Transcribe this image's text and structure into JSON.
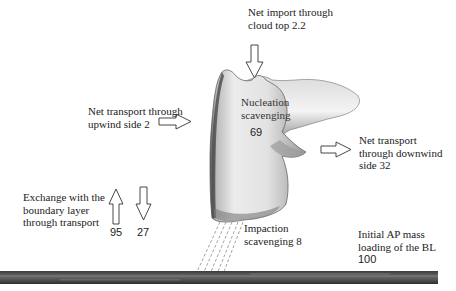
{
  "diagram": {
    "type": "aerosol-particle-budget-schematic",
    "labels": {
      "cloud_top": {
        "line1": "Net import through",
        "line2": "cloud top 2.2"
      },
      "nucleation": {
        "line1": "Nucleation",
        "line2": "scavenging",
        "value": "69"
      },
      "upwind": {
        "line1": "Net transport through",
        "line2": "upwind side 2"
      },
      "downwind": {
        "line1": "Net transport",
        "line2": "through downwind",
        "line3": "side 32"
      },
      "exchange": {
        "line1": "Exchange with the",
        "line2": "boundary layer",
        "line3": "through transport"
      },
      "exchange_up_value": "95",
      "exchange_down_value": "27",
      "impaction": {
        "line1": "Impaction",
        "line2": "scavenging 8"
      },
      "initial": {
        "line1": "Initial AP mass",
        "line2": "loading of the BL",
        "line3": "100"
      }
    },
    "arrows": [
      {
        "name": "cloud-top-import",
        "direction": "down"
      },
      {
        "name": "upwind-transport",
        "direction": "right"
      },
      {
        "name": "downwind-transport",
        "direction": "right"
      },
      {
        "name": "bl-exchange-up",
        "direction": "up"
      },
      {
        "name": "bl-exchange-down",
        "direction": "down"
      }
    ],
    "colors": {
      "cloud_light": "#f2f2f2",
      "cloud_shade": "#8a8a8a",
      "ground": "#4a4a4a",
      "arrow_stroke": "#333333"
    }
  }
}
